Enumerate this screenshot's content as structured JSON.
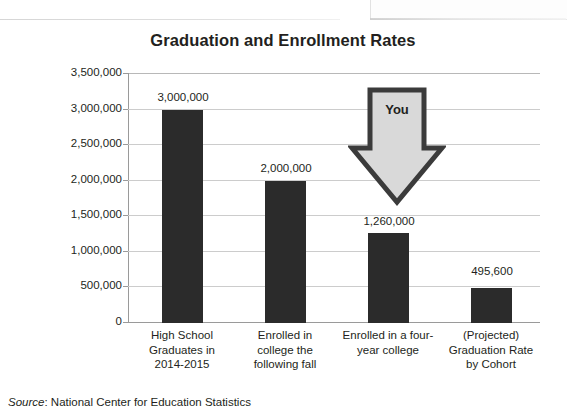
{
  "chart_data": {
    "type": "bar",
    "title": "Graduation and Enrollment Rates",
    "categories": [
      "High School Graduates in 2014-2015",
      "Enrolled in college the following fall",
      "Enrolled in a four-year college",
      "(Projected) Graduation Rate by Cohort"
    ],
    "category_lines": [
      [
        "High School",
        "Graduates in",
        "2014-2015"
      ],
      [
        "Enrolled in",
        "college the",
        "following fall"
      ],
      [
        "Enrolled in a four-",
        "year college"
      ],
      [
        "(Projected)",
        "Graduation Rate",
        "by Cohort"
      ]
    ],
    "values": [
      3000000,
      2000000,
      1260000,
      495600
    ],
    "value_labels": [
      "3,000,000",
      "2,000,000",
      "1,260,000",
      "495,600"
    ],
    "xlabel": "",
    "ylabel": "",
    "ylim": [
      0,
      3500000
    ],
    "ytick_values": [
      3500000,
      3000000,
      2500000,
      2000000,
      1500000,
      1000000,
      500000,
      0
    ],
    "ytick_labels": [
      "3,500,000",
      "3,000,000",
      "2,500,000",
      "2,000,000",
      "1,500,000",
      "1,000,000",
      "500,000",
      "0"
    ],
    "grid": true,
    "legend": false,
    "bar_color": "#2b2b2b",
    "gridline_color": "#cccccc",
    "annotations": [
      {
        "name": "you-arrow",
        "label": "You",
        "shape": "down-arrow",
        "points_at_category": "Enrolled in a four-year college",
        "fill_color": "#d9d9d9",
        "outline_color": "#3b3b3b"
      }
    ]
  },
  "source": {
    "word": "Source",
    "separator": ": ",
    "text": "National Center for Education Statistics"
  }
}
